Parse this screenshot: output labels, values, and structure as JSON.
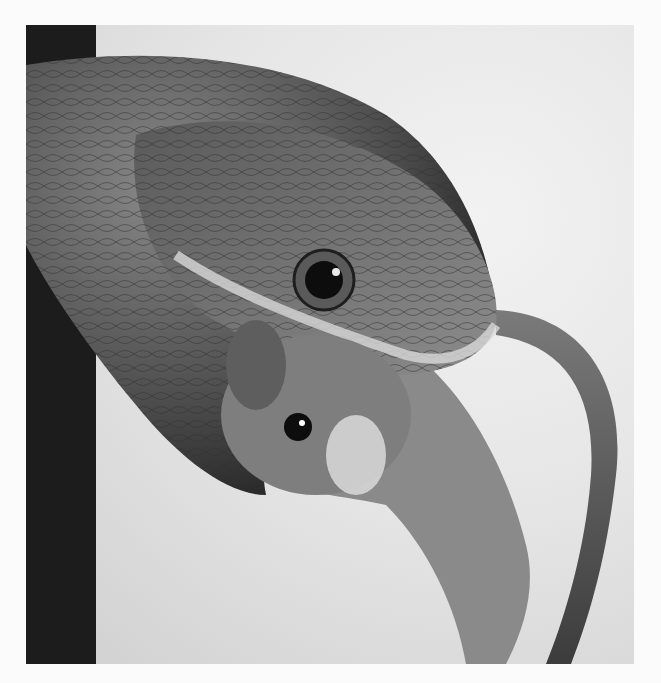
{
  "image": {
    "subject": "snake eating mouse",
    "style": "black-and-white photograph",
    "colors": {
      "page_background": "#fbfbfb",
      "photo_background": "#e6e6e6",
      "snake_dark": "#2a2a2a",
      "snake_mid": "#6e6e6e",
      "snake_light": "#bdbdbd",
      "mouse": "#8a8a8a",
      "eye": "#0d0d0d"
    }
  }
}
